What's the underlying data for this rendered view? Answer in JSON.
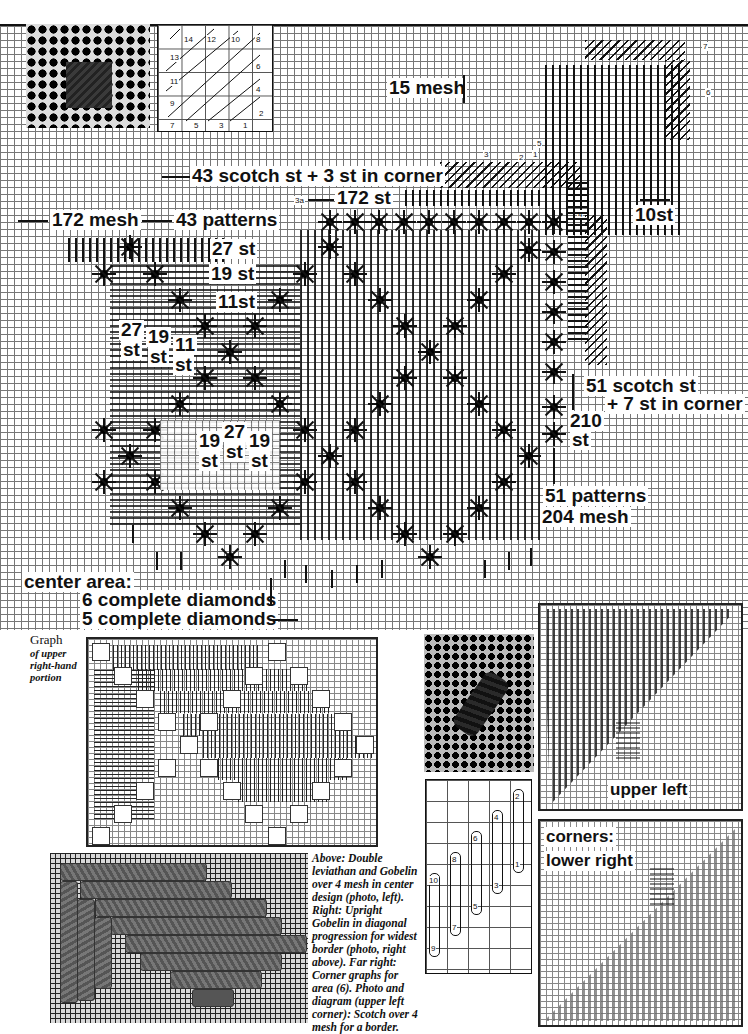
{
  "main_graph": {
    "labels": {
      "mesh_15": "15 mesh",
      "scotch_top": "43 scotch st + 3 st in corner",
      "st_172": "172 st",
      "label_3a": "3a",
      "mesh_172": "172 mesh",
      "patterns_43": "43 patterns",
      "st_27_row": "27 st",
      "st_19_row": "19 st",
      "st_11_row": "11st",
      "st_10": "10st",
      "scotch_side_1": "51 scotch st",
      "scotch_side_2": "+ 7 st in corner",
      "st_210_a": "210",
      "st_210_b": "st",
      "patterns_51": "51  patterns",
      "mesh_204": "204 mesh",
      "left_27_a": "27",
      "left_27_b": "st",
      "left_19_a": "19",
      "left_19_b": "st",
      "left_11_a": "11",
      "left_11_b": "st",
      "center_19a_a": "19",
      "center_19a_b": "st",
      "center_27_a": "27",
      "center_27_b": "st",
      "center_19b_a": "19",
      "center_19b_b": "st",
      "center_area": "center area:",
      "diamonds_6": "6 complete diamonds",
      "diamonds_5": "5 complete diamonds"
    },
    "area_numbers": [
      "1",
      "2",
      "3",
      "4",
      "5",
      "6",
      "7"
    ]
  },
  "scotch_diagram": {
    "numbers": [
      "14",
      "12",
      "10",
      "8",
      "13",
      "6",
      "11",
      "4",
      "9",
      "2",
      "7",
      "5",
      "3",
      "1"
    ]
  },
  "graph_caption": {
    "title": "Graph",
    "subtitle": "of upper right-hand portion"
  },
  "photo_caption": {
    "text": "Above: Double leviathan and Gobelin over 4 mesh in center design (photo, left). Right: Upright Gobelin in diagonal progression for widest border (photo, right above). Far right: Corner graphs for area (6). Photo and diagram (upper left corner): Scotch over 4 mesh for a border."
  },
  "gobelin_diagram": {
    "numbers": [
      "2",
      "1",
      "4",
      "3",
      "6",
      "5",
      "8",
      "7",
      "10",
      "9"
    ]
  },
  "corner_graphs": {
    "upper_left": "upper left",
    "corners": "corners:",
    "lower_right": "lower right"
  }
}
